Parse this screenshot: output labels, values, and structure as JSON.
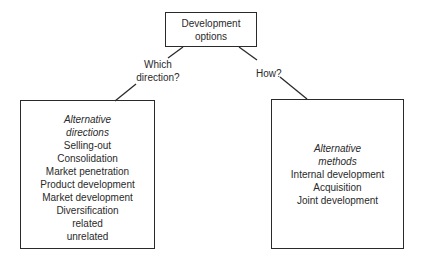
{
  "root": {
    "lines": [
      "Development",
      "options"
    ]
  },
  "edges": {
    "left_label": [
      "Which",
      "direction?"
    ],
    "right_label": "How?"
  },
  "left_box": {
    "heading": [
      "Alternative",
      "directions"
    ],
    "items": [
      "Selling-out",
      "Consolidation",
      "Market penetration",
      "Product development",
      "Market development",
      "Diversification",
      "related",
      "unrelated"
    ]
  },
  "right_box": {
    "heading": [
      "Alternative",
      "methods"
    ],
    "items": [
      "Internal development",
      "Acquisition",
      "Joint development"
    ]
  }
}
